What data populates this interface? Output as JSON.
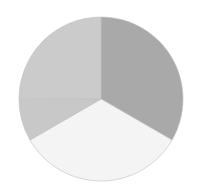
{
  "chart_data": {
    "type": "pie",
    "title": "",
    "legend": [],
    "start_angle_deg": 0,
    "direction": "clockwise",
    "center": [
      101,
      99
    ],
    "radius": 82,
    "slices": [
      {
        "label": "",
        "value": 33.3,
        "color": "#a9a9a9"
      },
      {
        "label": "",
        "value": 33.3,
        "color": "#f4f4f4"
      },
      {
        "label": "",
        "value": 8.3,
        "color": "#c8c8c8"
      },
      {
        "label": "",
        "value": 25.0,
        "color": "#cbcbcb"
      }
    ],
    "values": [
      33.3,
      33.3,
      8.3,
      25.0
    ],
    "categories": [
      "",
      "",
      "",
      ""
    ],
    "separator_color": "#c0c0c0"
  }
}
